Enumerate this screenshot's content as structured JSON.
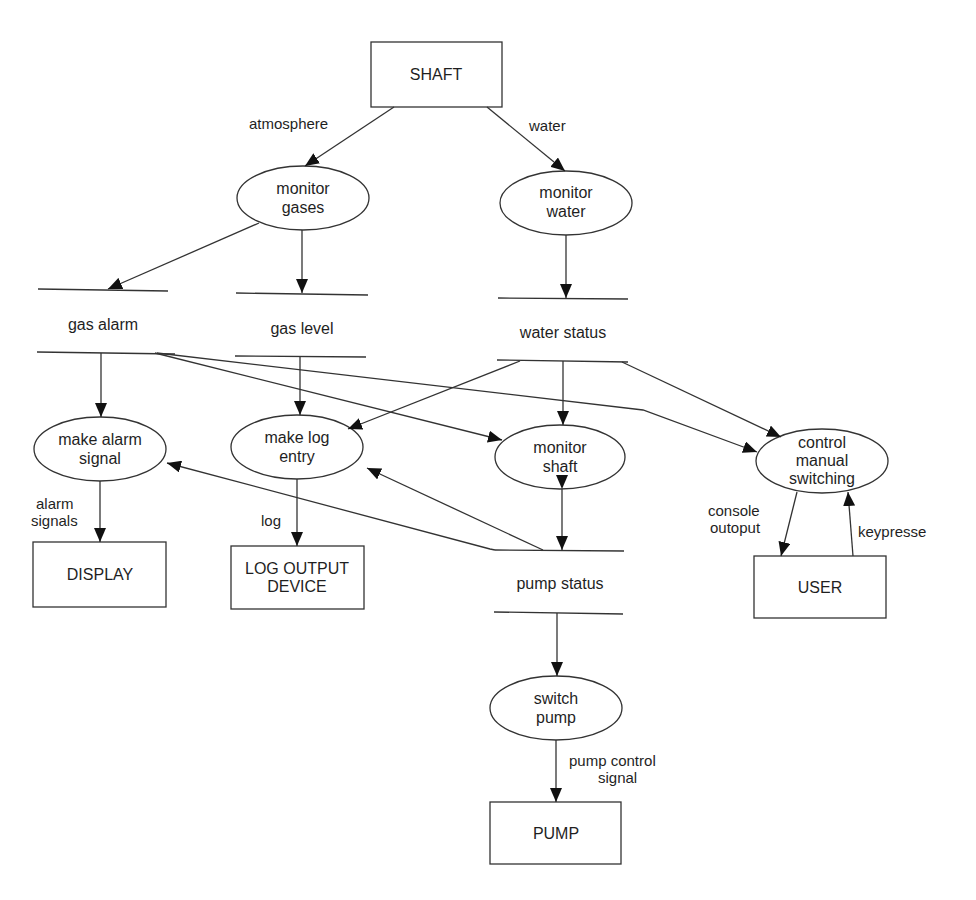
{
  "diagram": {
    "type": "data-flow-diagram",
    "externals": {
      "shaft": "SHAFT",
      "display": "DISPLAY",
      "log_output_device_l1": "LOG OUTPUT",
      "log_output_device_l2": "DEVICE",
      "user": "USER",
      "pump": "PUMP"
    },
    "processes": {
      "monitor_gases_l1": "monitor",
      "monitor_gases_l2": "gases",
      "monitor_water_l1": "monitor",
      "monitor_water_l2": "water",
      "make_alarm_signal_l1": "make alarm",
      "make_alarm_signal_l2": "signal",
      "make_log_entry_l1": "make log",
      "make_log_entry_l2": "entry",
      "monitor_shaft_l1": "monitor",
      "monitor_shaft_l2": "shaft",
      "control_manual_switching_l1": "control",
      "control_manual_switching_l2": "manual",
      "control_manual_switching_l3": "switching",
      "switch_pump_l1": "switch",
      "switch_pump_l2": "pump"
    },
    "stores": {
      "gas_alarm": "gas alarm",
      "gas_level": "gas level",
      "water_status": "water status",
      "pump_status": "pump status"
    },
    "flows": {
      "atmosphere": "atmosphere",
      "water": "water",
      "alarm_signals_l1": "alarm",
      "alarm_signals_l2": "signals",
      "log": "log",
      "console_output_l1": "console",
      "console_output_l2": "outoput",
      "keypresse": "keypresse",
      "pump_control_signal_l1": "pump control",
      "pump_control_signal_l2": "signal"
    },
    "edges": [
      {
        "from": "SHAFT",
        "to": "monitor gases",
        "label": "atmosphere"
      },
      {
        "from": "SHAFT",
        "to": "monitor water",
        "label": "water"
      },
      {
        "from": "monitor gases",
        "to": "gas alarm"
      },
      {
        "from": "monitor gases",
        "to": "gas level"
      },
      {
        "from": "monitor water",
        "to": "water status"
      },
      {
        "from": "gas alarm",
        "to": "make alarm signal"
      },
      {
        "from": "gas alarm",
        "to": "monitor shaft"
      },
      {
        "from": "gas alarm",
        "to": "control manual switching"
      },
      {
        "from": "gas level",
        "to": "make log entry"
      },
      {
        "from": "water status",
        "to": "make log entry"
      },
      {
        "from": "water status",
        "to": "monitor shaft"
      },
      {
        "from": "water status",
        "to": "control manual switching"
      },
      {
        "from": "pump status",
        "to": "make alarm signal"
      },
      {
        "from": "pump status",
        "to": "make log entry"
      },
      {
        "from": "monitor shaft",
        "to": "pump status",
        "bidirectional": true
      },
      {
        "from": "make alarm signal",
        "to": "DISPLAY",
        "label": "alarm signals"
      },
      {
        "from": "make log entry",
        "to": "LOG OUTPUT DEVICE",
        "label": "log"
      },
      {
        "from": "control manual switching",
        "to": "USER",
        "label": "console outoput"
      },
      {
        "from": "USER",
        "to": "control manual switching",
        "label": "keypresse"
      },
      {
        "from": "pump status",
        "to": "switch pump"
      },
      {
        "from": "switch pump",
        "to": "PUMP",
        "label": "pump control signal"
      }
    ]
  }
}
